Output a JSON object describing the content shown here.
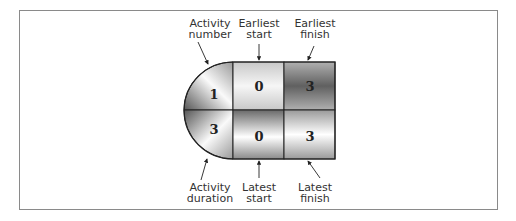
{
  "diagram": {
    "type": "activity-on-node legend",
    "node": {
      "activity_number": "1",
      "activity_duration": "3",
      "earliest_start": "0",
      "earliest_finish": "3",
      "latest_start": "0",
      "latest_finish": "3"
    },
    "labels": {
      "activity_number": [
        "Activity",
        "number"
      ],
      "earliest_start": [
        "Earliest",
        "start"
      ],
      "earliest_finish": [
        "Earliest",
        "finish"
      ],
      "activity_duration": [
        "Activity",
        "duration"
      ],
      "latest_start": [
        "Latest",
        "start"
      ],
      "latest_finish": [
        "Latest",
        "finish"
      ]
    }
  }
}
